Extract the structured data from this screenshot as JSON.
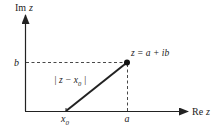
{
  "diagram": {
    "axes": {
      "vertical_label": {
        "prefix": "Im",
        "var": "z"
      },
      "horizontal_label": {
        "prefix": "Re",
        "var": "z"
      }
    },
    "labels": {
      "b": "b",
      "a": "a",
      "x0_base": "x",
      "x0_sub": "0",
      "point": "z = a + ib",
      "distance_open": "| z − x",
      "distance_sub": "0",
      "distance_close": " |"
    },
    "colors": {
      "ink": "#222222",
      "background": "#ffffff"
    }
  }
}
